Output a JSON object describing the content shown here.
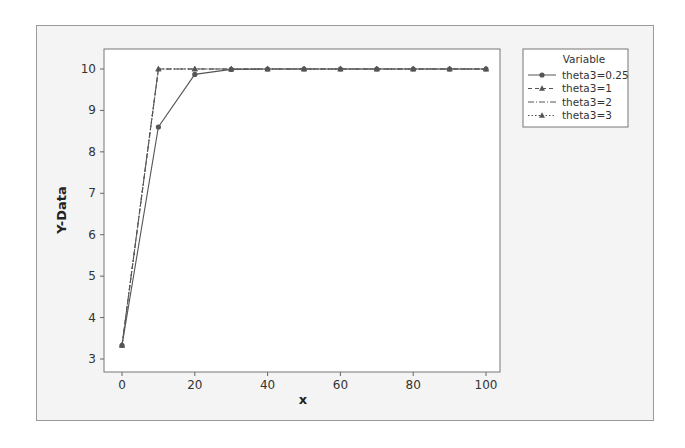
{
  "chart_data": {
    "type": "line",
    "title": "",
    "xlabel": "x",
    "ylabel": "Y-Data",
    "xlim": [
      0,
      100
    ],
    "ylim": [
      3,
      10
    ],
    "x_ticks": [
      0,
      20,
      40,
      60,
      80,
      100
    ],
    "y_ticks": [
      3,
      4,
      5,
      6,
      7,
      8,
      9,
      10
    ],
    "grid": false,
    "legend": {
      "title": "Variable",
      "position": "right-outside-top",
      "entries": [
        "theta3=0.25",
        "theta3=1",
        "theta3=2",
        "theta3=3"
      ]
    },
    "x": [
      0,
      10,
      20,
      30,
      40,
      50,
      60,
      70,
      80,
      90,
      100
    ],
    "series": [
      {
        "name": "theta3=0.25",
        "style": "solid",
        "marker": "circle",
        "values": [
          3.33,
          8.6,
          9.87,
          9.99,
          10,
          10,
          10,
          10,
          10,
          10,
          10
        ]
      },
      {
        "name": "theta3=1",
        "style": "dash",
        "marker": "triangle",
        "values": [
          3.33,
          10,
          10,
          10,
          10,
          10,
          10,
          10,
          10,
          10,
          10
        ]
      },
      {
        "name": "theta3=2",
        "style": "dot-dash",
        "marker": "none",
        "values": [
          3.33,
          10,
          10,
          10,
          10,
          10,
          10,
          10,
          10,
          10,
          10
        ]
      },
      {
        "name": "theta3=3",
        "style": "dotted",
        "marker": "triangle",
        "values": [
          3.33,
          10,
          10,
          10,
          10,
          10,
          10,
          10,
          10,
          10,
          10
        ]
      }
    ]
  },
  "colors": {
    "frame_bg": "#f4f4f4",
    "plot_bg": "#ffffff",
    "line": "#555555",
    "axis": "#666666"
  }
}
